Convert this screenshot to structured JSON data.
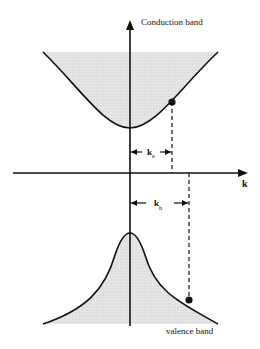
{
  "diagram": {
    "labels": {
      "conduction": "Conduction band",
      "valence": "valence band",
      "k_axis": "k",
      "k_e": "k",
      "k_e_sub": "e",
      "k_h": "k",
      "k_h_sub": "h"
    },
    "colors": {
      "line": "#111111",
      "fill": "#dcdcdc",
      "background": "#ffffff"
    }
  }
}
